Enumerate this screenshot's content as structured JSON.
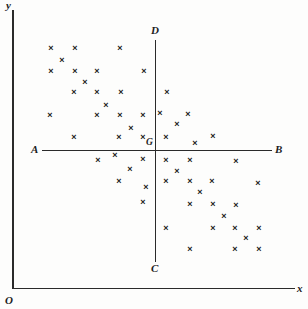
{
  "figure": {
    "point_glyph": "×",
    "point_color": "#1a1a1a",
    "axis_color": "#2a2a2a",
    "background_color": "#fdfdfc"
  },
  "axes": {
    "y_axis_label": "y",
    "x_axis_label": "x",
    "origin_label": "O"
  },
  "quadrant_lines": {
    "horizontal_left_label": "A",
    "horizontal_right_label": "B",
    "vertical_bottom_label": "C",
    "vertical_top_label": "D",
    "centroid_label": "G"
  },
  "chart_data": {
    "type": "scatter",
    "xlabel": "x",
    "ylabel": "y",
    "grid": false,
    "legend": null,
    "annotations": [
      "A",
      "B",
      "C",
      "D",
      "G",
      "O",
      "x",
      "y"
    ],
    "reference_lines": [
      {
        "name": "AB",
        "orientation": "horizontal",
        "label_start": "A",
        "label_end": "B",
        "pixel_y": 150,
        "pixel_x_start": 42,
        "pixel_x_end": 272
      },
      {
        "name": "CD",
        "orientation": "vertical",
        "label_start": "C",
        "label_end": "D",
        "pixel_x": 155,
        "pixel_y_start": 40,
        "pixel_y_end": 262
      }
    ],
    "centroid": {
      "label": "G",
      "pixel_x": 155,
      "pixel_y": 150
    },
    "series": [
      {
        "name": "observations",
        "marker": "x",
        "points": [
          [
            51,
            48
          ],
          [
            75,
            48
          ],
          [
            120,
            48
          ],
          [
            62,
            60
          ],
          [
            51,
            71
          ],
          [
            75,
            71
          ],
          [
            97,
            71
          ],
          [
            144,
            71
          ],
          [
            85,
            82
          ],
          [
            74,
            92
          ],
          [
            97,
            92
          ],
          [
            121,
            92
          ],
          [
            167,
            92
          ],
          [
            106,
            105
          ],
          [
            50,
            115
          ],
          [
            97,
            115
          ],
          [
            120,
            115
          ],
          [
            143,
            115
          ],
          [
            160,
            113
          ],
          [
            188,
            114
          ],
          [
            131,
            128
          ],
          [
            177,
            124
          ],
          [
            74,
            137
          ],
          [
            119,
            137
          ],
          [
            143,
            137
          ],
          [
            166,
            137
          ],
          [
            195,
            143
          ],
          [
            213,
            136
          ],
          [
            98,
            160
          ],
          [
            115,
            155
          ],
          [
            143,
            159
          ],
          [
            166,
            160
          ],
          [
            190,
            160
          ],
          [
            236,
            161
          ],
          [
            130,
            169
          ],
          [
            177,
            171
          ],
          [
            119,
            181
          ],
          [
            166,
            181
          ],
          [
            190,
            181
          ],
          [
            212,
            181
          ],
          [
            258,
            183
          ],
          [
            146,
            187
          ],
          [
            200,
            192
          ],
          [
            143,
            202
          ],
          [
            190,
            204
          ],
          [
            213,
            204
          ],
          [
            236,
            205
          ],
          [
            224,
            216
          ],
          [
            166,
            228
          ],
          [
            213,
            228
          ],
          [
            235,
            228
          ],
          [
            259,
            228
          ],
          [
            246,
            238
          ],
          [
            190,
            249
          ],
          [
            235,
            249
          ],
          [
            259,
            249
          ]
        ]
      }
    ],
    "point_count": 55
  }
}
